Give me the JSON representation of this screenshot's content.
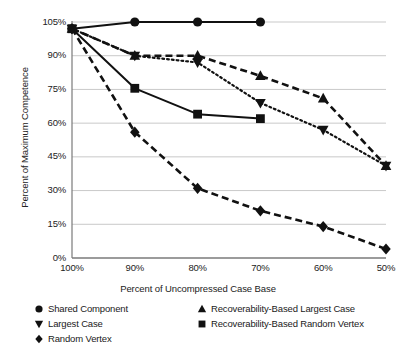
{
  "chart_data": {
    "type": "line",
    "title": "",
    "xlabel": "Percent of Uncompressed Case Base",
    "ylabel": "Percent of Maximum Competence",
    "x": [
      100,
      90,
      80,
      70,
      60,
      50
    ],
    "xticklabels": [
      "100%",
      "90%",
      "80%",
      "70%",
      "60%",
      "50%"
    ],
    "yticks": [
      0,
      15,
      30,
      45,
      60,
      75,
      90,
      105
    ],
    "yticklabels": [
      "0%",
      "15%",
      "30%",
      "45%",
      "60%",
      "75%",
      "90%",
      "105%"
    ],
    "ylim": [
      0,
      108
    ],
    "xlim": [
      102,
      48
    ],
    "grid": true,
    "legend_position": "below",
    "series": [
      {
        "name": "Shared Component",
        "marker": "circle",
        "linestyle": "solid",
        "x": [
          100,
          90,
          80,
          70
        ],
        "values": [
          102,
          105,
          105,
          105
        ]
      },
      {
        "name": "Largest Case",
        "marker": "triangle-down",
        "linestyle": "dotted",
        "x": [
          100,
          90,
          80,
          70,
          60,
          50
        ],
        "values": [
          102,
          90,
          87,
          69,
          57,
          41
        ]
      },
      {
        "name": "Random Vertex",
        "marker": "diamond",
        "linestyle": "dashed",
        "x": [
          100,
          90,
          80,
          70,
          60,
          50
        ],
        "values": [
          102,
          56,
          31,
          21,
          14,
          4
        ]
      },
      {
        "name": "Recoverability-Based Largest Case",
        "marker": "triangle-up",
        "linestyle": "dashed",
        "x": [
          100,
          90,
          80,
          70,
          60,
          50
        ],
        "values": [
          102,
          90,
          90,
          81,
          71,
          41
        ]
      },
      {
        "name": "Recoverability-Based Random Vertex",
        "marker": "square",
        "linestyle": "solid",
        "x": [
          100,
          90,
          80,
          70
        ],
        "values": [
          102,
          75.5,
          64,
          62
        ]
      }
    ]
  },
  "legend": {
    "columns": [
      {
        "items": [
          {
            "label": "Shared Component",
            "marker": "circle"
          },
          {
            "label": "Largest Case",
            "marker": "triangle-down"
          },
          {
            "label": "Random Vertex",
            "marker": "diamond"
          }
        ]
      },
      {
        "items": [
          {
            "label": "Recoverability-Based Largest Case",
            "marker": "triangle-up"
          },
          {
            "label": "Recoverability-Based Random Vertex",
            "marker": "square"
          }
        ]
      }
    ]
  },
  "style": {
    "ink": "#111111",
    "grid_color": "#c9c9c9",
    "axis_color": "#7a7a7a",
    "background": "#ffffff"
  }
}
